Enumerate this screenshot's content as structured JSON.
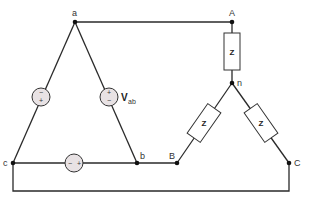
{
  "diagram": {
    "source_nodes": {
      "a": "a",
      "b": "b",
      "c": "c"
    },
    "load_nodes": {
      "A": "A",
      "B": "B",
      "C": "C",
      "n": "n"
    },
    "impedances": [
      {
        "label": "Z",
        "branch": "A-n"
      },
      {
        "label": "Z",
        "branch": "B-n"
      },
      {
        "label": "Z",
        "branch": "C-n"
      }
    ],
    "sources": [
      {
        "branch": "a-c",
        "top_sign": "−",
        "bottom_sign": "+"
      },
      {
        "branch": "a-b",
        "top_sign": "+",
        "bottom_sign": "−",
        "label": "V",
        "label_sub": "ab"
      },
      {
        "branch": "c-b",
        "left_sign": "−",
        "right_sign": "+"
      }
    ],
    "colors": {
      "wire": "#2a2a2a",
      "source_fill": "#e8e2e4",
      "node": "#111111"
    }
  }
}
